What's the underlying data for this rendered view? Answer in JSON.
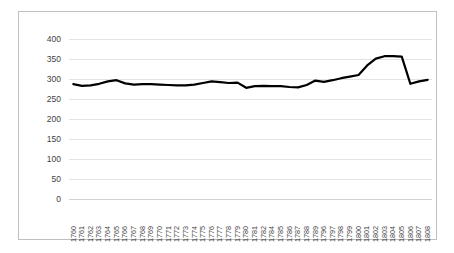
{
  "chart_data": {
    "type": "line",
    "title": "",
    "subtitle": "",
    "xlabel": "",
    "ylabel": "",
    "ylim": [
      0,
      400
    ],
    "ytick_step": 50,
    "yticks": [
      400,
      350,
      300,
      250,
      200,
      150,
      100,
      50,
      0
    ],
    "grid": "horizontal",
    "legend": "none",
    "line_color": "#000000",
    "line_width": 2.2,
    "plot_background": "#ffffff",
    "gridline_color": "#e3e3e3",
    "border_color": "#bfbfbf",
    "categories": [
      "1760",
      "1761",
      "1762",
      "1763",
      "1764",
      "1765",
      "1766",
      "1767",
      "1768",
      "1769",
      "1770",
      "1771",
      "1772",
      "1773",
      "1774",
      "1775",
      "1776",
      "1777",
      "1778",
      "1779",
      "1780",
      "1781",
      "1782",
      "1784",
      "1785",
      "1786",
      "1787",
      "1788",
      "1789",
      "1796",
      "1797",
      "1798",
      "1799",
      "1800",
      "1801",
      "1802",
      "1803",
      "1804",
      "1805",
      "1806",
      "1807",
      "1808"
    ],
    "values": [
      287,
      283,
      284,
      288,
      293,
      297,
      293,
      286,
      287,
      287,
      287,
      286,
      285,
      284,
      284,
      288,
      292,
      294,
      290,
      288,
      291,
      278,
      282,
      283,
      282,
      282,
      280,
      279,
      285,
      296,
      293,
      297,
      302,
      309,
      311,
      334,
      351,
      357,
      357,
      356,
      288,
      294
    ],
    "series": [
      {
        "name": "series-1",
        "values": [
          287,
          283,
          284,
          288,
          293,
          297,
          293,
          286,
          287,
          287,
          287,
          286,
          285,
          284,
          284,
          288,
          292,
          294,
          290,
          288,
          291,
          278,
          282,
          283,
          282,
          282,
          280,
          279,
          285,
          296,
          293,
          297,
          302,
          309,
          311,
          334,
          351,
          357,
          357,
          356,
          288,
          294
        ]
      }
    ]
  },
  "chart": {
    "points": [
      {
        "x": "1760",
        "y": 287
      },
      {
        "x": "1761",
        "y": 283
      },
      {
        "x": "1762",
        "y": 284
      },
      {
        "x": "1763",
        "y": 288
      },
      {
        "x": "1764",
        "y": 294
      },
      {
        "x": "1765",
        "y": 297
      },
      {
        "x": "1766",
        "y": 289
      },
      {
        "x": "1767",
        "y": 286
      },
      {
        "x": "1768",
        "y": 287
      },
      {
        "x": "1769",
        "y": 287
      },
      {
        "x": "1770",
        "y": 286
      },
      {
        "x": "1771",
        "y": 285
      },
      {
        "x": "1772",
        "y": 284
      },
      {
        "x": "1773",
        "y": 284
      },
      {
        "x": "1774",
        "y": 286
      },
      {
        "x": "1775",
        "y": 290
      },
      {
        "x": "1776",
        "y": 294
      },
      {
        "x": "1777",
        "y": 292
      },
      {
        "x": "1778",
        "y": 290
      },
      {
        "x": "1779",
        "y": 291
      },
      {
        "x": "1780",
        "y": 278
      },
      {
        "x": "1781",
        "y": 282
      },
      {
        "x": "1782",
        "y": 283
      },
      {
        "x": "1784",
        "y": 282
      },
      {
        "x": "1785",
        "y": 282
      },
      {
        "x": "1786",
        "y": 280
      },
      {
        "x": "1787",
        "y": 279
      },
      {
        "x": "1788",
        "y": 285
      },
      {
        "x": "1789",
        "y": 296
      },
      {
        "x": "1796",
        "y": 293
      },
      {
        "x": "1797",
        "y": 297
      },
      {
        "x": "1798",
        "y": 302
      },
      {
        "x": "1799",
        "y": 306
      },
      {
        "x": "1800",
        "y": 310
      },
      {
        "x": "1801",
        "y": 334
      },
      {
        "x": "1802",
        "y": 351
      },
      {
        "x": "1803",
        "y": 357
      },
      {
        "x": "1804",
        "y": 357
      },
      {
        "x": "1805",
        "y": 356
      },
      {
        "x": "1806",
        "y": 288
      },
      {
        "x": "1807",
        "y": 294
      },
      {
        "x": "1808",
        "y": 298
      }
    ]
  }
}
